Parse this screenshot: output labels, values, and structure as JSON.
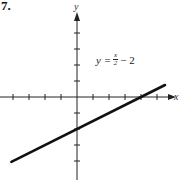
{
  "problem": {
    "number": "7."
  },
  "chart_data": {
    "type": "line",
    "title": "",
    "xlabel": "x",
    "ylabel": "y",
    "equation": {
      "lhs": "y =",
      "num": "x",
      "den": "2",
      "rest": "− 2"
    },
    "equation_text": "y = x/2 − 2",
    "series": [
      {
        "name": "y = x/2 - 2",
        "x": [
          -4.1,
          5.5
        ],
        "y": [
          -4.05,
          0.75
        ]
      }
    ],
    "x_ticks": [
      -4,
      -3,
      -2,
      -1,
      1,
      2,
      3,
      4,
      5
    ],
    "y_ticks": [
      -4,
      -3,
      -2,
      -1,
      1,
      2,
      3,
      4
    ],
    "xlim": [
      -4.8,
      6.2
    ],
    "ylim": [
      -5.5,
      6.0
    ],
    "grid": false,
    "x_intercept": 4,
    "y_intercept": -2,
    "colors": {
      "line": "#111111",
      "axis": "#222222"
    }
  }
}
